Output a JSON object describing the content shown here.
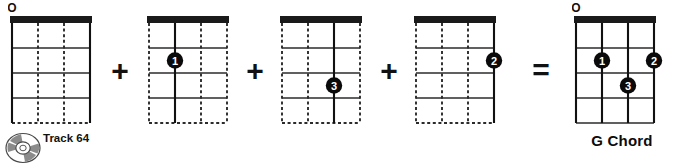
{
  "page": {
    "background_color": "#ffffff",
    "ink_color": "#111111"
  },
  "operators": [
    {
      "name": "plus-1",
      "symbol": "+"
    },
    {
      "name": "plus-2",
      "symbol": "+"
    },
    {
      "name": "plus-3",
      "symbol": "+"
    },
    {
      "name": "equals",
      "symbol": "="
    }
  ],
  "track_badge": {
    "icon": "compact-disc-icon",
    "label": "Track 64"
  },
  "diagram_defaults": {
    "string_count": 4,
    "fret_count": 4,
    "nut_color": "#1a1a1a",
    "marker_fill": "#0a0a0a",
    "marker_text_color": "#ffffff",
    "open_marker_symbol": "O"
  },
  "diagrams": [
    {
      "name": "chord-diagram-open-strings",
      "caption": "",
      "open_strings": [
        1
      ],
      "highlighted_strings": [
        1,
        4
      ],
      "fingerings": []
    },
    {
      "name": "chord-diagram-finger-1",
      "caption": "",
      "open_strings": [],
      "highlighted_strings": [
        2
      ],
      "fingerings": [
        {
          "finger": "1",
          "string": 2,
          "fret": 2
        }
      ]
    },
    {
      "name": "chord-diagram-finger-3",
      "caption": "",
      "open_strings": [],
      "highlighted_strings": [
        3
      ],
      "fingerings": [
        {
          "finger": "3",
          "string": 3,
          "fret": 3
        }
      ]
    },
    {
      "name": "chord-diagram-finger-2",
      "caption": "",
      "open_strings": [],
      "highlighted_strings": [
        4
      ],
      "fingerings": [
        {
          "finger": "2",
          "string": 4,
          "fret": 2
        }
      ]
    },
    {
      "name": "chord-diagram-result",
      "caption": "G Chord",
      "open_strings": [
        1
      ],
      "highlighted_strings": [
        1,
        2,
        3,
        4
      ],
      "fingerings": [
        {
          "finger": "1",
          "string": 2,
          "fret": 2
        },
        {
          "finger": "2",
          "string": 4,
          "fret": 2
        },
        {
          "finger": "3",
          "string": 3,
          "fret": 3
        }
      ]
    }
  ],
  "layout": {
    "diagram_left_positions": [
      8,
      145,
      278,
      412,
      572
    ],
    "operator_left_positions": [
      105,
      240,
      374,
      524
    ]
  }
}
